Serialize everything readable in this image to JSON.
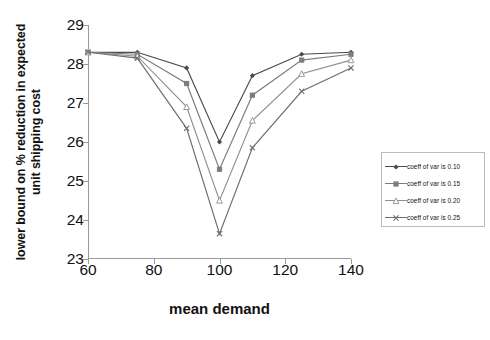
{
  "chart_data": {
    "type": "line",
    "title": "",
    "xlabel": "mean demand",
    "ylabel": "lower bound on % reduction in expected unit shipping cost",
    "ylabel_line1": "lower bound on % reduction in expected",
    "ylabel_line2": "unit shipping cost",
    "x": [
      60,
      75,
      90,
      100,
      110,
      125,
      140
    ],
    "xlim": [
      60,
      140
    ],
    "ylim": [
      23,
      29
    ],
    "xticks": [
      60,
      80,
      100,
      120,
      140
    ],
    "yticks": [
      23,
      24,
      25,
      26,
      27,
      28,
      29
    ],
    "grid": false,
    "legend_position": "right",
    "series": [
      {
        "name": "coeff of var is 0.10",
        "marker": "diamond",
        "color": "#4a4a4a",
        "values": [
          28.3,
          28.3,
          27.9,
          26.0,
          27.7,
          28.25,
          28.3
        ]
      },
      {
        "name": "coeff of var is 0.15",
        "marker": "square",
        "color": "#7d7d7d",
        "values": [
          28.3,
          28.25,
          27.5,
          25.3,
          27.2,
          28.1,
          28.25
        ]
      },
      {
        "name": "coeff of var is 0.20",
        "marker": "triangle",
        "color": "#8f8f8f",
        "values": [
          28.3,
          28.2,
          26.9,
          24.5,
          26.55,
          27.75,
          28.1
        ]
      },
      {
        "name": "coeff of var is 0.25",
        "marker": "x",
        "color": "#6e6e6e",
        "values": [
          28.3,
          28.15,
          26.35,
          23.65,
          25.85,
          27.3,
          27.9
        ]
      }
    ]
  },
  "axes": {
    "ytick_labels": [
      "29",
      "28",
      "27",
      "26",
      "25",
      "24",
      "23"
    ],
    "xtick_labels": [
      "60",
      "80",
      "100",
      "120",
      "140"
    ]
  },
  "legend": {
    "items": [
      {
        "label": "coeff of var is 0.10"
      },
      {
        "label": "coeff of var is 0.15"
      },
      {
        "label": "coeff of var is 0.20"
      },
      {
        "label": "coeff of var is 0.25"
      }
    ]
  }
}
